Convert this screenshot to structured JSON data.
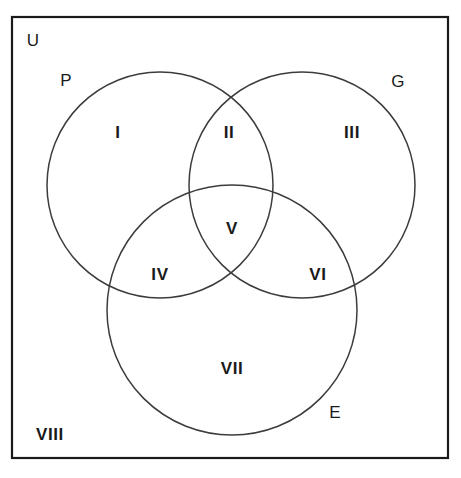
{
  "diagram": {
    "type": "venn-3-set",
    "background_color": "#ffffff",
    "stroke_color": "#3c3c3c",
    "border_color": "#1a1a1a",
    "text_color": "#1a1a1a",
    "universe": {
      "label": "U",
      "rect": {
        "x": 12,
        "y": 17,
        "width": 436,
        "height": 441
      },
      "label_pos": {
        "x": 33,
        "y": 40
      }
    },
    "sets": [
      {
        "name": "set-p",
        "label": "P",
        "cx": 160,
        "cy": 185,
        "r": 113,
        "label_pos": {
          "x": 66,
          "y": 80
        }
      },
      {
        "name": "set-g",
        "label": "G",
        "cx": 302,
        "cy": 185,
        "r": 113,
        "label_pos": {
          "x": 398,
          "y": 81
        }
      },
      {
        "name": "set-e",
        "label": "E",
        "cx": 232,
        "cy": 310,
        "r": 125,
        "label_pos": {
          "x": 335,
          "y": 412
        }
      }
    ],
    "regions": [
      {
        "name": "region-p-only",
        "label": "I",
        "x": 118,
        "y": 132
      },
      {
        "name": "region-p-g",
        "label": "II",
        "x": 229,
        "y": 132
      },
      {
        "name": "region-g-only",
        "label": "III",
        "x": 352,
        "y": 132
      },
      {
        "name": "region-p-g-e",
        "label": "V",
        "x": 232,
        "y": 228
      },
      {
        "name": "region-p-e",
        "label": "IV",
        "x": 160,
        "y": 274
      },
      {
        "name": "region-g-e",
        "label": "VI",
        "x": 318,
        "y": 274
      },
      {
        "name": "region-e-only",
        "label": "VII",
        "x": 232,
        "y": 368
      },
      {
        "name": "region-outside",
        "label": "VIII",
        "x": 50,
        "y": 434
      }
    ]
  }
}
